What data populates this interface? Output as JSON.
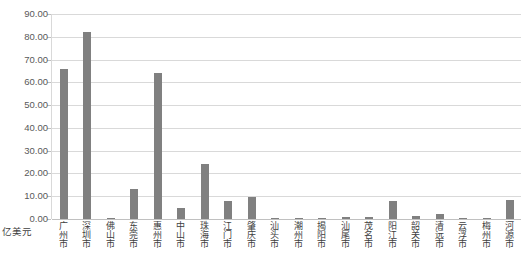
{
  "chart_data": {
    "type": "bar",
    "title": "",
    "subtitle": "",
    "xlabel": "",
    "ylabel": "亿美元",
    "unit_label": "亿美元",
    "ylim": [
      0,
      90
    ],
    "ytick_step": 10,
    "grid": true,
    "legend": false,
    "bar_color": "#808080",
    "gridline_color": "#d9d9d9",
    "axis_text_color": "#595959",
    "ytick_labels": [
      "90.00",
      "80.00",
      "70.00",
      "60.00",
      "50.00",
      "40.00",
      "30.00",
      "20.00",
      "10.00",
      "0.00"
    ],
    "ytick_values": [
      90,
      80,
      70,
      60,
      50,
      40,
      30,
      20,
      10,
      0
    ],
    "categories": [
      "广州市",
      "深圳市",
      "佛山市",
      "东莞市",
      "惠州市",
      "中山市",
      "珠海市",
      "江门市",
      "肇庆市",
      "汕头市",
      "潮州市",
      "揭阳市",
      "汕尾市",
      "茂名市",
      "阳江市",
      "韶关市",
      "清远市",
      "云浮市",
      "梅州市",
      "河源市"
    ],
    "values": [
      66.0,
      82.0,
      0.3,
      13.0,
      64.0,
      4.8,
      24.0,
      8.0,
      9.5,
      0.5,
      0.4,
      0.5,
      1.0,
      0.8,
      8.0,
      1.2,
      2.0,
      0.3,
      0.4,
      8.2
    ]
  }
}
